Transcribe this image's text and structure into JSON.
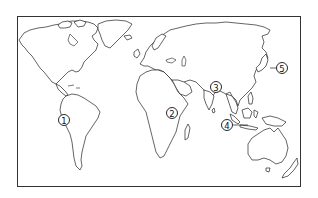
{
  "map": {
    "type": "world-outline-map",
    "frame": {
      "x": 17,
      "y": 16,
      "width": 283,
      "height": 170
    },
    "colors": {
      "stroke": "#222222",
      "background": "#ffffff"
    },
    "markers": [
      {
        "id": 1,
        "label": "1",
        "symbol": "①",
        "x": 64,
        "y": 120,
        "leader": null,
        "region": "south-america-northwest"
      },
      {
        "id": 2,
        "label": "2",
        "symbol": "②",
        "x": 172,
        "y": 113,
        "leader": null,
        "region": "central-africa"
      },
      {
        "id": 3,
        "label": "3",
        "symbol": "③",
        "x": 216,
        "y": 87,
        "leader": null,
        "region": "south-asia"
      },
      {
        "id": 4,
        "label": "4",
        "symbol": "④",
        "x": 227,
        "y": 125,
        "leader": {
          "x2": 248,
          "y2": 125
        },
        "region": "maritime-southeast-asia"
      },
      {
        "id": 5,
        "label": "5",
        "symbol": "⑤",
        "x": 282,
        "y": 68,
        "leader": {
          "x2": 270,
          "y2": 68
        },
        "region": "japan"
      }
    ]
  }
}
